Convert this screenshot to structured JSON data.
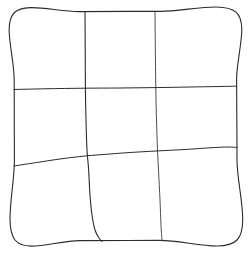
{
  "figure": {
    "name": "hand-drawn-grid",
    "width": 249,
    "height": 254,
    "background_color": "#ffffff",
    "ink_color": "#1a1a1a",
    "ink_color_light": "#6b6b6b",
    "ink_color_faint": "#9a9a9a"
  },
  "chart_data": {
    "type": "diagram",
    "title": "",
    "subtitle": "",
    "xlabel": "",
    "ylabel": "",
    "grid": true,
    "legend": "none",
    "rows": 3,
    "columns": 3,
    "stroke_style": "hand-drawn",
    "border": {
      "name": "outer-square-border",
      "corners": {
        "top_left": [
          14,
          12
        ],
        "top_right": [
          236,
          12
        ],
        "bottom_right": [
          237,
          240
        ],
        "bottom_left": [
          15,
          240
        ]
      }
    },
    "lines": [
      {
        "name": "outer-border",
        "orientation": "closed-path",
        "color": "#2b2b2b",
        "width": 1.1,
        "points": [
          [
            14,
            13
          ],
          [
            80,
            11.6
          ],
          [
            160,
            11.4
          ],
          [
            236,
            12.2
          ],
          [
            236.6,
            80
          ],
          [
            237,
            160
          ],
          [
            237,
            240
          ],
          [
            160,
            240.4
          ],
          [
            80,
            240.6
          ],
          [
            15,
            240
          ],
          [
            14.4,
            160
          ],
          [
            14.2,
            80
          ],
          [
            14,
            13
          ]
        ]
      },
      {
        "name": "vertical-line-1",
        "orientation": "vertical",
        "color": "#2b2b2b",
        "width": 1.1,
        "description": "first internal vertical; curves sharply right near bottom",
        "points": [
          [
            85,
            12
          ],
          [
            85.2,
            45
          ],
          [
            85.4,
            88
          ],
          [
            86,
            120
          ],
          [
            87,
            150
          ],
          [
            88.5,
            168
          ],
          [
            90,
            195
          ],
          [
            92,
            215
          ],
          [
            95,
            230
          ],
          [
            99,
            238
          ],
          [
            102,
            241.5
          ]
        ]
      },
      {
        "name": "vertical-line-2",
        "orientation": "vertical",
        "color": "#3a3a3a",
        "width": 0.9,
        "description": "second internal vertical; faint at top, straighter overall",
        "points": [
          [
            155,
            12
          ],
          [
            155.3,
            45
          ],
          [
            155.8,
            88
          ],
          [
            156.5,
            120
          ],
          [
            157.5,
            150
          ],
          [
            158.5,
            170
          ],
          [
            160,
            200
          ],
          [
            161,
            225
          ],
          [
            162,
            240.5
          ]
        ]
      },
      {
        "name": "horizontal-line-1",
        "orientation": "horizontal",
        "color": "#2b2b2b",
        "width": 1.0,
        "description": "upper internal horizontal; nearly level, slight rise to the right",
        "points": [
          [
            14,
            89.5
          ],
          [
            45,
            88.8
          ],
          [
            85,
            88.2
          ],
          [
            120,
            88
          ],
          [
            155,
            87.6
          ],
          [
            190,
            87
          ],
          [
            215,
            86.6
          ],
          [
            236,
            86.2
          ]
        ]
      },
      {
        "name": "horizontal-line-2",
        "orientation": "horizontal",
        "color": "#2b2b2b",
        "width": 1.0,
        "description": "lower internal horizontal; slopes upward from left to right",
        "points": [
          [
            14,
            166
          ],
          [
            40,
            162
          ],
          [
            60,
            159
          ],
          [
            85,
            156
          ],
          [
            110,
            154
          ],
          [
            130,
            152.5
          ],
          [
            156,
            151
          ],
          [
            185,
            149.5
          ],
          [
            210,
            147.8
          ],
          [
            228,
            147
          ],
          [
            237,
            147.5
          ]
        ]
      }
    ]
  }
}
